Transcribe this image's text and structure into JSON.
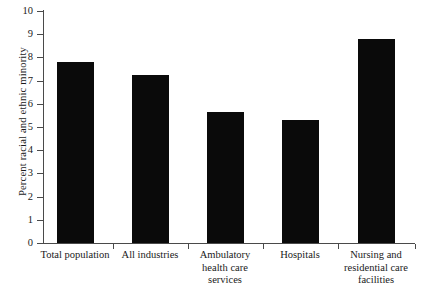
{
  "chart_data": {
    "type": "bar",
    "title": "",
    "subtitle": "",
    "xlabel": "",
    "ylabel": "Percent racial and ethnic minority",
    "ylim": [
      0,
      10
    ],
    "ytick_labels": [
      "0",
      "1",
      "2",
      "3",
      "4",
      "5",
      "6",
      "7",
      "8",
      "9",
      "10"
    ],
    "ytick_values": [
      0,
      1,
      2,
      3,
      4,
      5,
      6,
      7,
      8,
      9,
      10
    ],
    "grid": false,
    "legend": null,
    "bar_color": "#0a0a0a",
    "axis_color": "#4a4a4a",
    "background_color": "#ffffff",
    "categories": [
      "Total population",
      "All industries",
      "Ambulatory health care services",
      "Hospitals",
      "Nursing and residential care facilities"
    ],
    "category_label_lines": [
      [
        "Total population"
      ],
      [
        "All industries"
      ],
      [
        "Ambulatory",
        "health care",
        "services"
      ],
      [
        "Hospitals"
      ],
      [
        "Nursing and",
        "residential care",
        "facilities"
      ]
    ],
    "values": [
      7.8,
      7.25,
      5.65,
      5.3,
      8.8
    ]
  },
  "axis": {
    "y_title": "Percent racial and ethnic minority"
  }
}
